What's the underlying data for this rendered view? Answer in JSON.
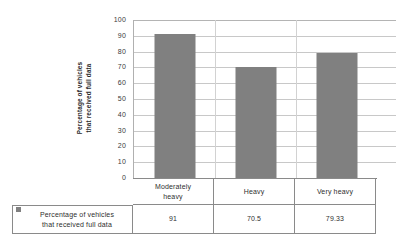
{
  "chart_data": {
    "type": "bar",
    "title": "",
    "xlabel": "",
    "ylabel": "Percentage of vehicles that received full data",
    "ylabel_lines": [
      "Percentage of vehicles",
      "that received full data"
    ],
    "categories": [
      "Moderately heavy",
      "Heavy",
      "Very heavy"
    ],
    "category_lines": [
      [
        "Moderately",
        "heavy"
      ],
      [
        "Heavy"
      ],
      [
        "Very heavy"
      ]
    ],
    "series": [
      {
        "name": "Percentage of vehicles that received full data",
        "values": [
          91,
          70.5,
          79.33
        ],
        "value_labels": [
          "91",
          "70.5",
          "79.33"
        ],
        "color": "#808080"
      }
    ],
    "ylim": [
      0,
      100
    ],
    "yticks": [
      0,
      10,
      20,
      30,
      40,
      50,
      60,
      70,
      80,
      90,
      100
    ],
    "ytick_labels": [
      "0",
      "10",
      "20",
      "30",
      "40",
      "50",
      "60",
      "70",
      "80",
      "90",
      "100"
    ],
    "grid": true,
    "grid_axis": "y",
    "legend_position": "bottom-table",
    "data_table_visible": true
  },
  "legend": {
    "marker": "legend-swatch-gray",
    "label_lines": [
      "Percentage of vehicles",
      "that received full data"
    ],
    "color": "#808080"
  },
  "colors": {
    "bar_fill": "#808080",
    "gridline": "#c8c8c8",
    "axis": "#7d7d7d",
    "table_border": "#8a8a8a",
    "text": "#2f2f2f",
    "background": "#ffffff"
  }
}
